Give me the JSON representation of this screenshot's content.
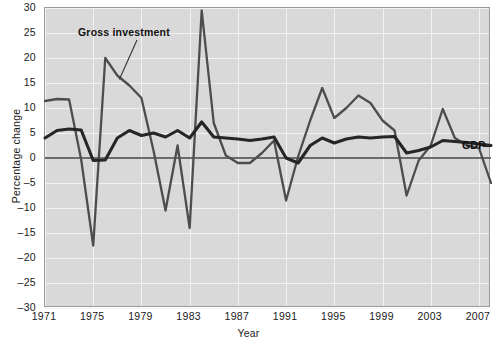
{
  "chart_data": {
    "type": "line",
    "title": "",
    "xlabel": "Year",
    "ylabel": "Percentage change",
    "xlim": [
      1971,
      2008
    ],
    "ylim": [
      -30,
      30
    ],
    "ytick_step": 5,
    "xtick_step": 4,
    "grid": true,
    "legend_position": "inline-annotations",
    "yticks": [
      30,
      25,
      20,
      15,
      10,
      5,
      0,
      -5,
      -10,
      -15,
      -20,
      -25,
      -30
    ],
    "ytick_labels": [
      "30",
      "25",
      "20",
      "15",
      "10",
      "5",
      "0",
      "-5",
      "-10",
      "-15",
      "-20",
      "-25",
      "-30"
    ],
    "xticks": [
      1971,
      1975,
      1979,
      1983,
      1987,
      1991,
      1995,
      1999,
      2003,
      2007
    ],
    "xtick_labels": [
      "1971",
      "1975",
      "1979",
      "1983",
      "1987",
      "1991",
      "1995",
      "1999",
      "2003",
      "2007"
    ],
    "x": [
      1971,
      1972,
      1973,
      1974,
      1975,
      1976,
      1977,
      1978,
      1979,
      1980,
      1981,
      1982,
      1983,
      1984,
      1985,
      1986,
      1987,
      1988,
      1989,
      1990,
      1991,
      1992,
      1993,
      1994,
      1995,
      1996,
      1997,
      1998,
      1999,
      2000,
      2001,
      2002,
      2003,
      2004,
      2005,
      2006,
      2007,
      2008
    ],
    "series": [
      {
        "name": "Gross investment",
        "color": "#4d4d4d",
        "values": [
          11.4,
          11.8,
          11.7,
          -0.3,
          -17.5,
          20.0,
          16.5,
          14.5,
          12.0,
          1.5,
          -10.5,
          2.5,
          -14.0,
          29.5,
          7.0,
          0.5,
          -1.0,
          -1.0,
          1.0,
          3.5,
          -8.5,
          0.3,
          7.5,
          14.0,
          8.0,
          10.0,
          12.5,
          11.0,
          7.5,
          5.5,
          -7.5,
          -0.5,
          2.5,
          9.8,
          4.0,
          2.5,
          2.0,
          -5.0
        ]
      },
      {
        "name": "GDP",
        "color": "#262626",
        "values": [
          4.0,
          5.5,
          5.8,
          5.6,
          -0.5,
          -0.4,
          4.0,
          5.5,
          4.5,
          5.0,
          4.2,
          5.5,
          4.0,
          7.2,
          4.2,
          4.0,
          3.8,
          3.5,
          3.8,
          4.2,
          0.0,
          -1.0,
          2.5,
          4.0,
          3.0,
          3.8,
          4.2,
          4.0,
          4.2,
          4.3,
          1.0,
          1.5,
          2.2,
          3.5,
          3.3,
          3.1,
          2.8,
          2.5
        ]
      }
    ],
    "annotations": [
      {
        "name": "Gross investment",
        "text": "Gross investment"
      },
      {
        "name": "GDP",
        "text": "GDP"
      }
    ]
  }
}
